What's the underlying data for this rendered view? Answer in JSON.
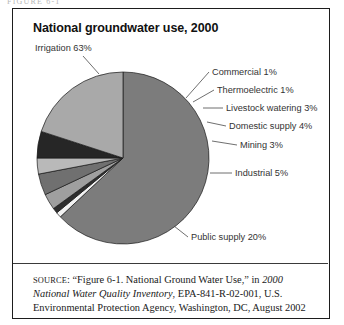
{
  "page": {
    "running_head": "FIGURE 6-1"
  },
  "figure": {
    "title": "National groundwater use, 2000",
    "source_prefix": "SOURCE",
    "source_part1": ": “Figure 6-1. National Ground Water Use,” in ",
    "source_italic1": "2000 National Water Quality Inventory",
    "source_part2": ", EPA-841-R-02-001, U.S. Environmental Protection Agency, Washington, DC, August 2002"
  },
  "chart_data": {
    "type": "pie",
    "title": "National groundwater use, 2000",
    "units": "percent",
    "start_angle_deg": 90,
    "direction": "clockwise",
    "legend": "none-labels-with-leader-lines",
    "categories": [
      "Irrigation",
      "Commercial",
      "Thermoelectric",
      "Livestock watering",
      "Domestic supply",
      "Mining",
      "Industrial",
      "Public supply"
    ],
    "values": [
      63,
      1,
      1,
      3,
      4,
      3,
      5,
      20
    ],
    "labels": [
      "Irrigation 63%",
      "Commercial 1%",
      "Thermoelectric 1%",
      "Livestock watering 3%",
      "Domestic supply 4%",
      "Mining 3%",
      "Industrial 5%",
      "Public supply 20%"
    ],
    "colors": [
      "#7c7c7c",
      "#f2f2f2",
      "#2e2e2e",
      "#9f9f9f",
      "#707070",
      "#b9b9b9",
      "#262626",
      "#a9a9a9"
    ],
    "slice_stroke": "#1a1a1a",
    "text_color": "#333333"
  }
}
